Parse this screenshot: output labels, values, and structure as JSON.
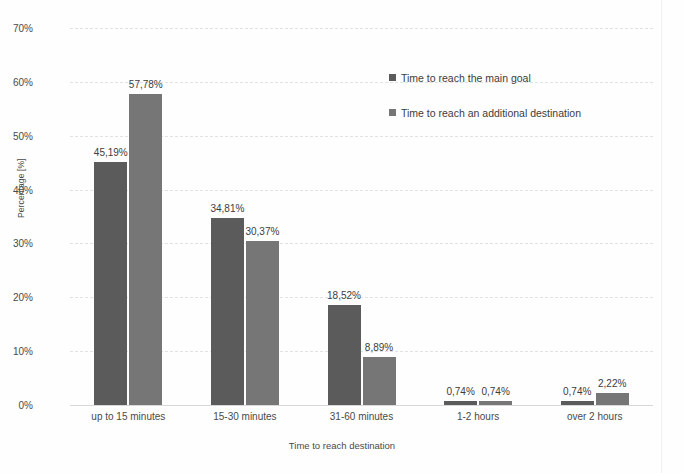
{
  "chart_data": {
    "type": "bar",
    "title": "",
    "xlabel": "Time to reach destination",
    "ylabel": "Percentage [%]",
    "ylim": [
      0,
      70
    ],
    "ytick_labels": [
      "0%",
      "10%",
      "20%",
      "30%",
      "40%",
      "50%",
      "60%",
      "70%"
    ],
    "ytick_values": [
      0,
      10,
      20,
      30,
      40,
      50,
      60,
      70
    ],
    "grid": true,
    "legend_position": "upper-center",
    "categories": [
      "up to 15 minutes",
      "15-30 minutes",
      "31-60 minutes",
      "1-2 hours",
      "over 2 hours"
    ],
    "series": [
      {
        "name": "Time to reach the main goal",
        "color": "#5b5b5b",
        "values": [
          45.19,
          34.81,
          18.52,
          0.74,
          0.74
        ],
        "labels": [
          "45,19%",
          "34,81%",
          "18,52%",
          "0,74%",
          "0,74%"
        ]
      },
      {
        "name": "Time to reach an additional destination",
        "color": "#767676",
        "values": [
          57.78,
          30.37,
          8.89,
          0.74,
          2.22
        ],
        "labels": [
          "57,78%",
          "30,37%",
          "8,89%",
          "0,74%",
          "2,22%"
        ]
      }
    ]
  }
}
